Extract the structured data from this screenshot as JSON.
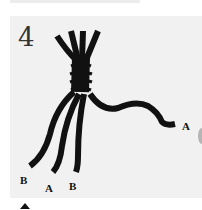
{
  "figure": {
    "step_number": "4",
    "rope_color": "#111111",
    "background_color": "#f1f1f1",
    "labels": [
      {
        "id": "right-strand",
        "text": "A"
      },
      {
        "id": "bottom-left",
        "text": "B"
      },
      {
        "id": "bottom-mid",
        "text": "A"
      },
      {
        "id": "bottom-right",
        "text": "B"
      }
    ]
  },
  "navigation": {
    "arrow_icon": "up-arrow-icon"
  }
}
